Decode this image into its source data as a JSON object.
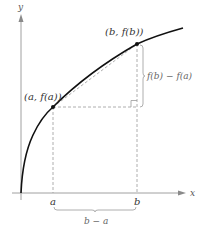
{
  "diagram": {
    "type": "secant-line-of-concave-function",
    "axes": {
      "x_label": "x",
      "y_label": "y"
    },
    "points": {
      "a_point_label": "(a, f(a))",
      "b_point_label": "(b, f(b))"
    },
    "ticks": {
      "a": "a",
      "b": "b"
    },
    "brackets": {
      "vertical_label": "f(b) − f(a)",
      "horizontal_label": "b − a"
    },
    "colors": {
      "curve": "#111111",
      "axes": "#999999",
      "dashed": "#999999",
      "points": "#111111"
    }
  }
}
